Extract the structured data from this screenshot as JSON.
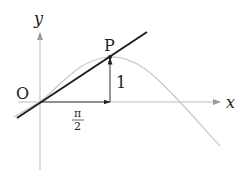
{
  "diagram": {
    "labels": {
      "y_axis": "y",
      "x_axis": "x",
      "origin": "O",
      "point": "P",
      "height": "1",
      "x_tick_numerator": "π",
      "x_tick_denominator": "2"
    },
    "colors": {
      "axis": "#b8b8b8",
      "curve": "#c8c8c8",
      "tangent": "#222222",
      "arrow": "#222222",
      "text": "#222222"
    }
  }
}
